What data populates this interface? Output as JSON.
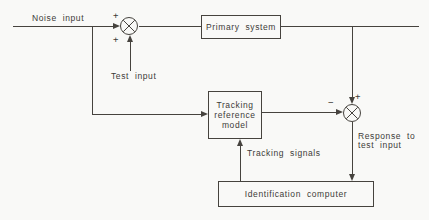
{
  "diagram": {
    "colors": {
      "background": "#f9f9f7",
      "line": "#46433e",
      "text": "#3d3b37"
    },
    "labels": {
      "noise_input": "Noise input",
      "test_input": "Test input",
      "tracking_signals": "Tracking signals",
      "response_line1": "Response to",
      "response_line2": "test input"
    },
    "blocks": {
      "primary_system": "Primary system",
      "tracking_model": {
        "lines": [
          "Tracking",
          "reference",
          "model"
        ]
      },
      "identification_computer": "Identification computer"
    },
    "junctions": {
      "input_sum": {
        "sign_upper": "+",
        "sign_lower": "+"
      },
      "compare_sum": {
        "sign_left": "−",
        "sign_right": "+"
      }
    }
  }
}
